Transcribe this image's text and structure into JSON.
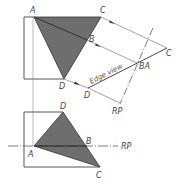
{
  "figure": {
    "colors": {
      "face_fill": "#6e6e6e",
      "line": "#444444",
      "projector": "#666666",
      "background": "#ffffff"
    },
    "top_view": {
      "labels": {
        "A": "A",
        "C": "C",
        "B": "B",
        "D": "D"
      }
    },
    "auxiliary_view": {
      "labels": {
        "C": "C",
        "BA": "BA",
        "D": "D",
        "RP": "RP"
      },
      "edge_view_label": "Edge view"
    },
    "front_view": {
      "labels": {
        "D": "D",
        "A": "A",
        "B": "B",
        "C": "C",
        "RP": "RP"
      }
    }
  }
}
